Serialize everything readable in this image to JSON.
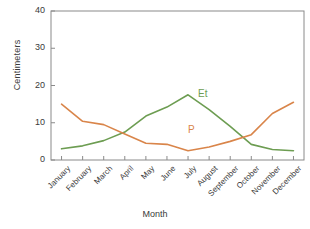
{
  "chart_data": {
    "type": "line",
    "title": "",
    "xlabel": "Month",
    "ylabel": "Centimeters",
    "categories": [
      "January",
      "February",
      "March",
      "April",
      "May",
      "June",
      "July",
      "August",
      "September",
      "October",
      "November",
      "December"
    ],
    "ylim": [
      0,
      40
    ],
    "yticks": [
      0,
      10,
      20,
      30,
      40
    ],
    "grid": false,
    "legend_position": "inline-annotation",
    "series": [
      {
        "name": "Et",
        "color": "#6d9d52",
        "values": [
          3.0,
          3.8,
          5.2,
          7.5,
          11.8,
          14.2,
          17.5,
          13.5,
          9.0,
          4.2,
          2.8,
          2.5
        ],
        "annotation": "Et"
      },
      {
        "name": "P",
        "color": "#d9854a",
        "values": [
          15.0,
          10.4,
          9.5,
          7.0,
          4.5,
          4.2,
          2.5,
          3.5,
          5.0,
          6.8,
          12.5,
          15.5
        ],
        "annotation": "P"
      }
    ]
  },
  "axis": {
    "y_tick_labels": [
      "0",
      "10",
      "20",
      "30",
      "40"
    ],
    "y_axis_title": "Centimeters",
    "x_axis_title": "Month",
    "x_tick_labels": [
      "January",
      "February",
      "March",
      "April",
      "May",
      "June",
      "July",
      "August",
      "September",
      "October",
      "November",
      "December"
    ]
  },
  "annotations": {
    "et_label": "Et",
    "p_label": "P"
  },
  "colors": {
    "series_et": "#6d9d52",
    "series_p": "#d9854a",
    "frame": "#8a8a8a",
    "text": "#3a3a3a"
  }
}
